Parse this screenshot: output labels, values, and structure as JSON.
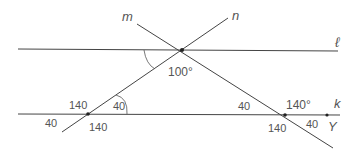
{
  "diagram": {
    "type": "parallel lines cut by transversals",
    "lines": {
      "l": {
        "label": "ℓ"
      },
      "k": {
        "label": "k"
      },
      "m": {
        "label": "m"
      },
      "n": {
        "label": "n"
      }
    },
    "points": {
      "Y": {
        "label": "Y"
      }
    },
    "angle_labels": {
      "top_intersection": "100°",
      "left_k_above_left": "140",
      "left_k_above_right": "40",
      "left_k_below_left": "40",
      "left_k_below_right": "140",
      "right_k_above_left": "40",
      "right_k_above_right": "140°",
      "right_k_below_left": "140",
      "right_k_below_right": "40"
    },
    "colors": {
      "line": "#333333",
      "text": "#555555"
    }
  }
}
